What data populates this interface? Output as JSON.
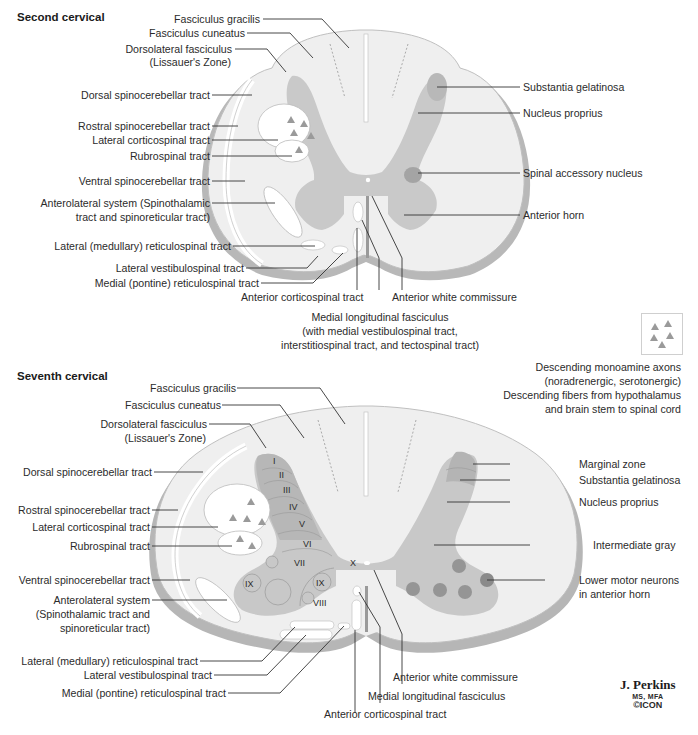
{
  "colors": {
    "white_matter": "#f0f0f0",
    "gray_matter": "#c8c8c8",
    "gray_dark": "#a8a8a8",
    "motor_neuron": "#8e8e8e",
    "tract_fill": "#ffffff",
    "triangle": "#9a9a9a",
    "outline": "#b5b5b5",
    "leader": "#333333"
  },
  "second_cervical": {
    "title": "Second cervical",
    "left_labels": [
      "Fasciculus gracilis",
      "Fasciculus cuneatus",
      "Dorsolateral fasciculus",
      "(Lissauer's Zone)",
      "Dorsal spinocerebellar tract",
      "Rostral spinocerebellar tract",
      "Lateral corticospinal tract",
      "Rubrospinal tract",
      "Ventral spinocerebellar tract",
      "Anterolateral system (Spinothalamic",
      "tract and spinoreticular tract)",
      "Lateral (medullary) reticulospinal tract",
      "Lateral vestibulospinal tract",
      "Medial (pontine) reticulospinal tract"
    ],
    "right_labels": [
      "Substantia gelatinosa",
      "Nucleus proprius",
      "Spinal accessory nucleus",
      "Anterior horn"
    ],
    "bottom_labels": {
      "anterior_corticospinal": "Anterior corticospinal tract",
      "anterior_white_commissure": "Anterior white commissure",
      "mlf_line1": "Medial longitudinal fasciculus",
      "mlf_line2": "(with medial vestibulospinal tract,",
      "mlf_line3": "interstitiospinal tract, and tectospinal tract)"
    }
  },
  "legend": {
    "icon": "triangles-icon",
    "lines": [
      "Descending monoamine axons",
      "(noradrenergic, serotonergic)",
      "Descending fibers from hypothalamus",
      "and brain stem to spinal cord"
    ]
  },
  "seventh_cervical": {
    "title": "Seventh cervical",
    "left_labels": [
      "Fasciculus gracilis",
      "Fasciculus cuneatus",
      "Dorsolateral fasciculus",
      "(Lissauer's Zone)",
      "Dorsal spinocerebellar tract",
      "Rostral spinocerebellar tract",
      "Lateral corticospinal tract",
      "Rubrospinal tract",
      "Ventral spinocerebellar tract",
      "Anterolateral system",
      "(Spinothalamic tract and",
      "spinoreticular tract)",
      "Lateral (medullary) reticulospinal tract",
      "Lateral vestibulospinal tract",
      "Medial (pontine) reticulospinal tract"
    ],
    "right_labels": [
      "Marginal zone",
      "Substantia gelatinosa",
      "Nucleus proprius",
      "Intermediate gray",
      "Lower motor neurons",
      "in anterior horn"
    ],
    "bottom_labels": {
      "anterior_white_commissure": "Anterior white commissure",
      "mlf": "Medial longitudinal fasciculus",
      "anterior_corticospinal": "Anterior corticospinal tract"
    },
    "rexed_laminae": [
      "I",
      "II",
      "III",
      "IV",
      "V",
      "VI",
      "VII",
      "VIII",
      "IX",
      "IX",
      "X"
    ]
  },
  "signature": {
    "name": "J. Perkins",
    "degrees": "MS, MFA",
    "logo": "©ICON"
  }
}
